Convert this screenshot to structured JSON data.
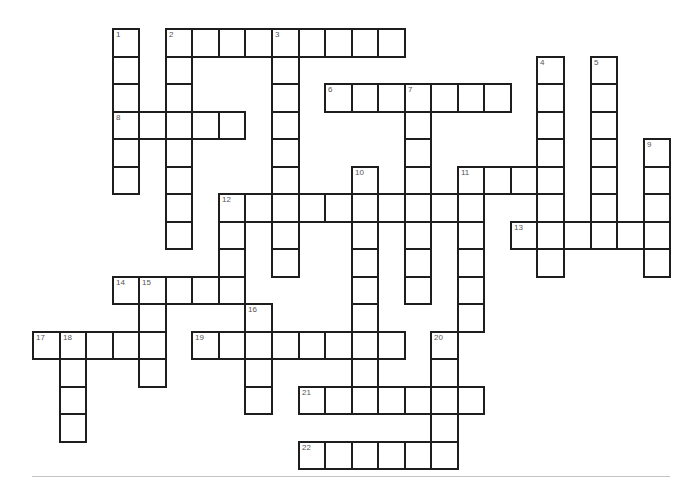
{
  "puzzle": {
    "type": "crossword",
    "grid": {
      "origin_x": 32,
      "origin_y": 28,
      "cell_width": 26.55,
      "cell_height": 27.5,
      "border_color": "#1e1e1e",
      "number_color": "#555555"
    },
    "entries": [
      {
        "number": 1,
        "direction": "down",
        "col": 3,
        "row": 0,
        "length": 6
      },
      {
        "number": 2,
        "direction": "across",
        "col": 5,
        "row": 0,
        "length": 9
      },
      {
        "number": 2,
        "direction": "down",
        "col": 5,
        "row": 0,
        "length": 8
      },
      {
        "number": 3,
        "direction": "down",
        "col": 9,
        "row": 0,
        "length": 9
      },
      {
        "number": 4,
        "direction": "down",
        "col": 19,
        "row": 1,
        "length": 8
      },
      {
        "number": 5,
        "direction": "down",
        "col": 21,
        "row": 1,
        "length": 7
      },
      {
        "number": 6,
        "direction": "across",
        "col": 11,
        "row": 2,
        "length": 7
      },
      {
        "number": 7,
        "direction": "down",
        "col": 14,
        "row": 2,
        "length": 8
      },
      {
        "number": 8,
        "direction": "across",
        "col": 3,
        "row": 3,
        "length": 5
      },
      {
        "number": 9,
        "direction": "down",
        "col": 23,
        "row": 4,
        "length": 5
      },
      {
        "number": 10,
        "direction": "down",
        "col": 12,
        "row": 5,
        "length": 9
      },
      {
        "number": 11,
        "direction": "across",
        "col": 16,
        "row": 5,
        "length": 4
      },
      {
        "number": 11,
        "direction": "down",
        "col": 16,
        "row": 5,
        "length": 6
      },
      {
        "number": 12,
        "direction": "across",
        "col": 7,
        "row": 6,
        "length": 10
      },
      {
        "number": 12,
        "direction": "down",
        "col": 7,
        "row": 6,
        "length": 4
      },
      {
        "number": 13,
        "direction": "across",
        "col": 18,
        "row": 7,
        "length": 6
      },
      {
        "number": 14,
        "direction": "across",
        "col": 3,
        "row": 9,
        "length": 5
      },
      {
        "number": 15,
        "direction": "down",
        "col": 4,
        "row": 9,
        "length": 4
      },
      {
        "number": 16,
        "direction": "down",
        "col": 8,
        "row": 10,
        "length": 4
      },
      {
        "number": 17,
        "direction": "across",
        "col": 0,
        "row": 11,
        "length": 5
      },
      {
        "number": 18,
        "direction": "down",
        "col": 1,
        "row": 11,
        "length": 4
      },
      {
        "number": 19,
        "direction": "across",
        "col": 6,
        "row": 11,
        "length": 8
      },
      {
        "number": 20,
        "direction": "down",
        "col": 15,
        "row": 11,
        "length": 5
      },
      {
        "number": 21,
        "direction": "across",
        "col": 10,
        "row": 13,
        "length": 7
      },
      {
        "number": 22,
        "direction": "across",
        "col": 10,
        "row": 15,
        "length": 6
      }
    ],
    "numbers": [
      "1",
      "2",
      "3",
      "4",
      "5",
      "6",
      "7",
      "8",
      "9",
      "10",
      "11",
      "12",
      "13",
      "14",
      "15",
      "16",
      "17",
      "18",
      "19",
      "20",
      "21",
      "22"
    ]
  }
}
